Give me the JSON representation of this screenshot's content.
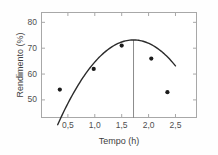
{
  "chart_data": {
    "type": "scatter",
    "title": "",
    "xlabel": "Tempo (h)",
    "ylabel": "Rendimento (%)",
    "xlim": [
      0.0,
      2.9
    ],
    "ylim": [
      43.0,
      84.0
    ],
    "grid": false,
    "legend": null,
    "x_ticks": [
      0.5,
      1.0,
      1.5,
      2.0,
      2.5
    ],
    "x_tick_labels": [
      "0,5",
      "1,0",
      "1,5",
      "2,0",
      "2,5"
    ],
    "y_ticks": [
      50,
      60,
      70,
      80
    ],
    "y_tick_labels": [
      "50",
      "60",
      "70",
      "80"
    ],
    "points": [
      {
        "x": 0.35,
        "y": 54
      },
      {
        "x": 0.98,
        "y": 62
      },
      {
        "x": 1.5,
        "y": 71
      },
      {
        "x": 2.05,
        "y": 66
      },
      {
        "x": 2.35,
        "y": 53
      }
    ],
    "fit_curve": {
      "name": "quadratic fit",
      "x_start": 0.31,
      "x_end": 2.5,
      "vertex_x": 1.72,
      "vertex_y": 73.2,
      "a": -16.5
    },
    "reference_line": {
      "orientation": "vertical",
      "x": 1.72,
      "y_top": 73.2,
      "y_bottom": 43.0
    },
    "colors": {
      "marker": "#1c1c1c",
      "curve": "#2b2b2b",
      "frame": "#a8a8a8",
      "reference_line": "#8c8c8c",
      "text": "#4f4f4f",
      "background": "#ffffff"
    }
  }
}
